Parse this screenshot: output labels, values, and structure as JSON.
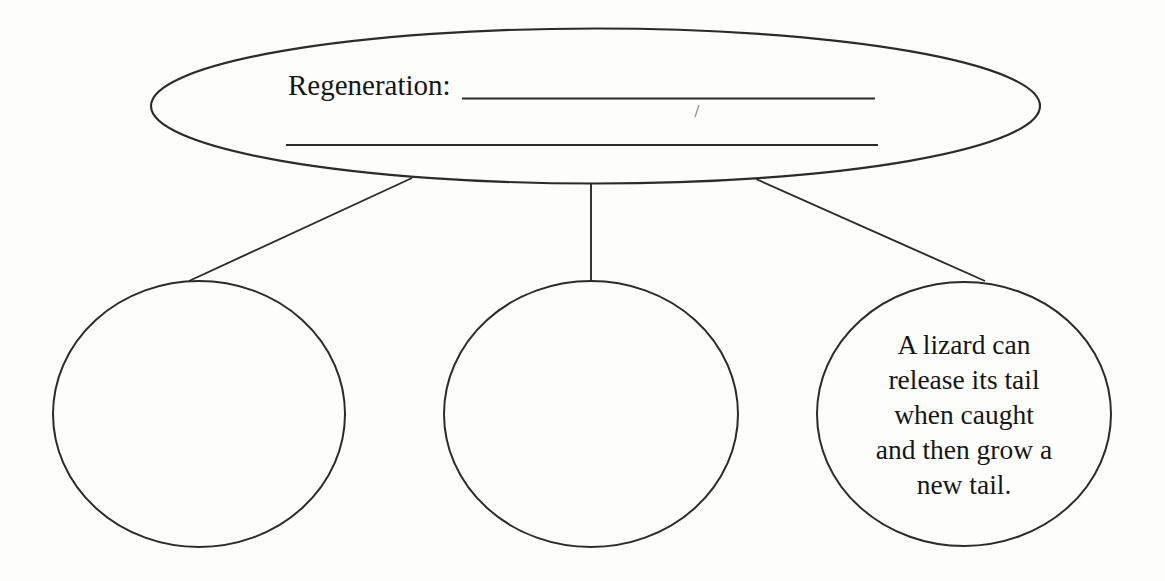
{
  "diagram": {
    "type": "concept-map",
    "root": {
      "label": "Regeneration:",
      "blank_lines": 2
    },
    "nodes": [
      {
        "id": "left-bubble",
        "text": ""
      },
      {
        "id": "middle-bubble",
        "text": ""
      },
      {
        "id": "right-bubble",
        "lines": [
          "A lizard can",
          "release its tail",
          "when caught",
          "and then grow a",
          "new tail."
        ]
      }
    ],
    "colors": {
      "stroke": "#2b2b2b",
      "text": "#161616",
      "background": "#fdfdfc",
      "artifact": "#9a9a9a"
    }
  }
}
